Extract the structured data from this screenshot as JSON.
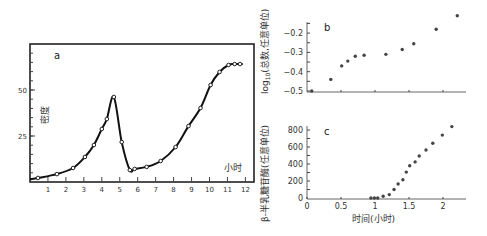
{
  "chart_data": [
    {
      "panel": "a",
      "type": "line",
      "xlabel": "小时",
      "ylabel": "密度",
      "xticks": [
        "1",
        "2",
        "3",
        "4",
        "5",
        "6",
        "7",
        "8",
        "9",
        "10",
        "11",
        "12"
      ],
      "yticks": [
        "25",
        "50"
      ],
      "xlim": [
        0,
        12.5
      ],
      "ylim": [
        0,
        75
      ],
      "x": [
        0.44,
        1.5,
        2.4,
        3.06,
        3.56,
        4.0,
        4.28,
        4.67,
        5.11,
        5.56,
        5.83,
        6.5,
        7.28,
        8.11,
        8.83,
        9.5,
        10.06,
        10.56,
        11.06,
        11.4,
        11.7
      ],
      "values": [
        2.2,
        4.3,
        7.6,
        13.6,
        20.1,
        28.8,
        34.2,
        46.2,
        21.7,
        6.5,
        7.1,
        8.2,
        11.4,
        19.0,
        30.4,
        40.2,
        52.7,
        59.8,
        63.6,
        64.1,
        64.1
      ]
    },
    {
      "panel": "b",
      "type": "scatter",
      "xlabel": "",
      "ylabel": "log₁₀(总数,任意单位)",
      "yticks": [
        "-0.2",
        "-0.3",
        "-0.4",
        "-0.5"
      ],
      "xlim": [
        0,
        2.3
      ],
      "ylim": [
        -0.5,
        -0.1
      ],
      "x": [
        0.07,
        0.35,
        0.51,
        0.6,
        0.71,
        0.84,
        1.16,
        1.4,
        1.57,
        1.9,
        2.21
      ],
      "values": [
        -0.5,
        -0.44,
        -0.37,
        -0.345,
        -0.32,
        -0.315,
        -0.31,
        -0.285,
        -0.255,
        -0.18,
        -0.11
      ]
    },
    {
      "panel": "c",
      "type": "scatter",
      "xlabel": "时间(小时)",
      "ylabel": "β-半乳糖苷酶(任意单位)",
      "xticks": [
        "0",
        "0.5",
        "1",
        "1.5",
        "2"
      ],
      "yticks": [
        "0",
        "200",
        "400",
        "600",
        "800"
      ],
      "xlim": [
        0,
        2.3
      ],
      "ylim": [
        0,
        850
      ],
      "x": [
        0.94,
        0.99,
        1.04,
        1.12,
        1.21,
        1.28,
        1.34,
        1.41,
        1.46,
        1.51,
        1.59,
        1.65,
        1.75,
        1.85,
        1.99,
        2.13
      ],
      "values": [
        0,
        0,
        0,
        20,
        40,
        100,
        165,
        215,
        305,
        380,
        425,
        495,
        565,
        645,
        740,
        840
      ]
    }
  ],
  "panels": {
    "a": {
      "label": "a",
      "xlabel": "小时",
      "ylabel": "密度"
    },
    "b": {
      "label": "b",
      "ylabel_prefix": "log",
      "ylabel_sub": "10",
      "ylabel_rest": "(总数,任意单位)"
    },
    "c": {
      "label": "c",
      "xlabel": "时间(小时)",
      "ylabel": "β-半乳糖苷酶(任意单位)"
    }
  },
  "ticks": {
    "a_x": [
      "1",
      "2",
      "3",
      "4",
      "5",
      "6",
      "7",
      "8",
      "9",
      "10",
      "11",
      "12"
    ],
    "a_y": [
      "50",
      "25"
    ],
    "b_y": [
      "-0.2",
      "-0.3",
      "-0.4",
      "-0.5"
    ],
    "c_y": [
      "800",
      "600",
      "400",
      "200",
      "0"
    ],
    "c_x": [
      "0",
      "0.5",
      "1",
      "1.5",
      "2"
    ]
  }
}
